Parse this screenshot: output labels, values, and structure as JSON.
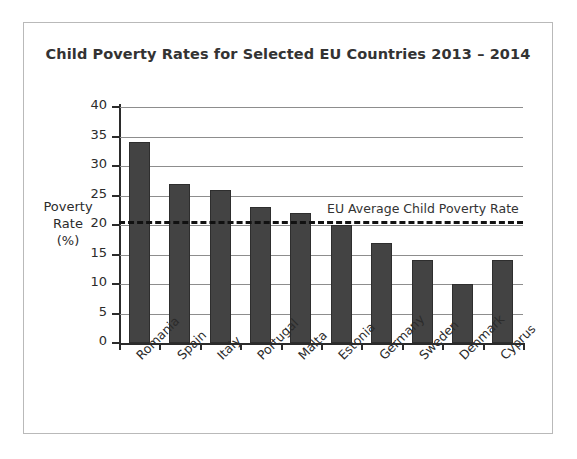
{
  "chart_data": {
    "type": "bar",
    "title": "Child Poverty Rates for Selected EU Countries 2013 – 2014",
    "xlabel": "",
    "ylabel_lines": [
      "Poverty",
      "Rate",
      "(%)"
    ],
    "categories": [
      "Romania",
      "Spain",
      "Italy",
      "Portugal",
      "Malta",
      "Estonia",
      "Germany",
      "Sweden",
      "Denmark",
      "Cyprus"
    ],
    "values": [
      34,
      27,
      26,
      23,
      22,
      20,
      17,
      14,
      10,
      14
    ],
    "ylim": [
      0,
      40
    ],
    "yticks": [
      0,
      5,
      10,
      15,
      20,
      25,
      30,
      35,
      40
    ],
    "ytick_labels": [
      "0",
      "5",
      "10",
      "15",
      "20",
      "25",
      "30",
      "35",
      "40"
    ],
    "grid": true,
    "legend": "none",
    "annotations": [
      {
        "label": "EU Average Child Poverty Rate",
        "value": 20.6,
        "style": "dashed-horizontal-line"
      }
    ],
    "bar_color": "#434343",
    "gridline_color": "#8d8d8d",
    "annotation_color": "#111111"
  }
}
